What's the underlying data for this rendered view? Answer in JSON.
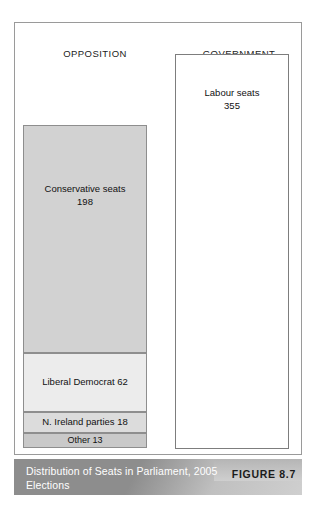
{
  "figure": {
    "headings": {
      "opposition": "OPPOSITION",
      "government": "GOVERNMENT"
    },
    "caption": "Distribution of Seats in Parliament, 2005 Elections",
    "figure_number": "FIGURE 8.7"
  },
  "chart_data": {
    "type": "bar",
    "title": "Distribution of Seats in Parliament, 2005 Elections",
    "subtitle": "",
    "xlabel": "",
    "ylabel": "Seats",
    "orientation": "vertical-stacked",
    "grid": false,
    "legend": "none",
    "total_seats": 646,
    "columns": [
      {
        "name": "OPPOSITION",
        "total": 291,
        "stacked": true,
        "segments": [
          {
            "label": "Conservative seats",
            "value": 198,
            "color": "#d2d2d2"
          },
          {
            "label": "Liberal Democrat",
            "value": 62,
            "color": "#ececec"
          },
          {
            "label": "N. Ireland parties",
            "value": 18,
            "color": "#dcdcdc"
          },
          {
            "label": "Other",
            "value": 13,
            "color": "#c9c9c9"
          }
        ]
      },
      {
        "name": "GOVERNMENT",
        "total": 355,
        "stacked": false,
        "segments": [
          {
            "label": "Labour seats",
            "value": 355,
            "color": "#ffffff"
          }
        ]
      }
    ]
  },
  "labels": {
    "conservative_name": "Conservative seats",
    "conservative_value": "198",
    "libdem": "Liberal Democrat 62",
    "nireland": "N. Ireland parties 18",
    "other": "Other 13",
    "labour_name": "Labour seats",
    "labour_value": "355"
  },
  "colors": {
    "frame_border": "#9a9a9a",
    "segment_border": "#8e8e8e",
    "caption_band": "#8d8d8d",
    "caption_text": "#ffffff",
    "figure_number_text": "#1b1b1b"
  }
}
